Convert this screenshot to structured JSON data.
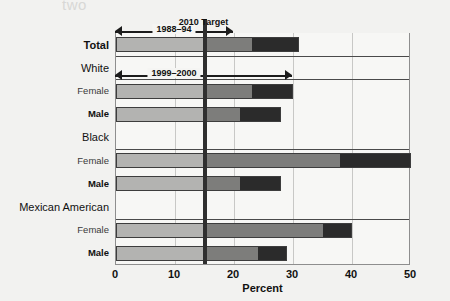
{
  "page": {
    "bleed_text_top": "two"
  },
  "chart_data": {
    "type": "bar",
    "orientation": "horizontal",
    "title": "",
    "xlabel": "Percent",
    "ylabel": "",
    "xlim": [
      0,
      50
    ],
    "xticks": [
      0,
      10,
      20,
      30,
      40,
      50
    ],
    "grid": true,
    "legend_position": "none",
    "target_value": 15,
    "target_label": "2010 Target",
    "annotations": [
      {
        "label": "1988–94",
        "from": 0,
        "to": 20
      },
      {
        "label": "1999–2000",
        "from": 0,
        "to": 30
      }
    ],
    "series": [
      {
        "name": "1988–94",
        "color": "#7d7d7b"
      },
      {
        "name": "1999–2000",
        "color": "#2b2b2b"
      }
    ],
    "categories": [
      {
        "label": "Total",
        "level": "group",
        "bold": true,
        "v1": 23.0,
        "v2": 31.0
      },
      {
        "label": "White",
        "level": "group",
        "bold": false,
        "v1": null,
        "v2": null
      },
      {
        "label": "Female",
        "level": "sub-f",
        "bold": false,
        "v1": 23.0,
        "v2": 30.0
      },
      {
        "label": "Male",
        "level": "sub-m",
        "bold": true,
        "v1": 21.0,
        "v2": 28.0
      },
      {
        "label": "Black",
        "level": "group",
        "bold": false,
        "v1": null,
        "v2": null
      },
      {
        "label": "Female",
        "level": "sub-f",
        "bold": false,
        "v1": 38.0,
        "v2": 50.0
      },
      {
        "label": "Male",
        "level": "sub-m",
        "bold": true,
        "v1": 21.0,
        "v2": 28.0
      },
      {
        "label": "Mexican American",
        "level": "group",
        "bold": false,
        "v1": null,
        "v2": null
      },
      {
        "label": "Female",
        "level": "sub-f",
        "bold": false,
        "v1": 35.0,
        "v2": 40.0
      },
      {
        "label": "Male",
        "level": "sub-m",
        "bold": true,
        "v1": 24.0,
        "v2": 29.0
      }
    ]
  },
  "colors": {
    "segment_base": "#b3b3b1",
    "segment_mid": "#7d7d7b",
    "segment_dark": "#2b2b2b",
    "target_line": "#2f2f2f",
    "axis": "#8e8e8e",
    "grid": "#c8c8c6"
  }
}
